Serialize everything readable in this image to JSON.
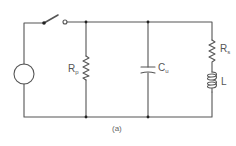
{
  "diagram": {
    "type": "circuit-schematic",
    "caption": "(a)",
    "colors": {
      "wire": "#555555",
      "background": "#ffffff"
    },
    "components": {
      "source": {
        "label": "",
        "kind": "ac-source"
      },
      "switch": {
        "label": "",
        "state": "open"
      },
      "rp": {
        "main": "R",
        "sub": "p",
        "kind": "resistor"
      },
      "cu": {
        "main": "C",
        "sub": "u",
        "kind": "capacitor"
      },
      "rs": {
        "main": "R",
        "sub": "s",
        "kind": "resistor"
      },
      "l": {
        "main": "L",
        "sub": "",
        "kind": "inductor"
      }
    }
  }
}
